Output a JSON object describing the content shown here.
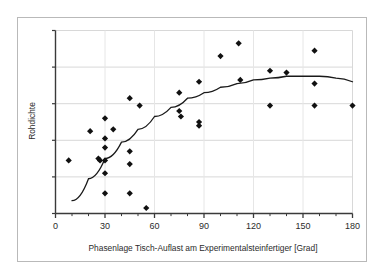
{
  "chart_data": {
    "type": "scatter",
    "title": "",
    "xlabel": "Phasenlage Tisch-Auflast am Experimentalsteinfertiger [Grad]",
    "ylabel": "Rohdichte",
    "xlim": [
      0,
      180
    ],
    "ylim": [
      0,
      100
    ],
    "xticks": [
      0,
      30,
      60,
      90,
      120,
      150,
      180
    ],
    "xtick_labels": [
      "0",
      "30",
      "60",
      "90",
      "120",
      "150",
      "180"
    ],
    "xminor_tick_step": 10,
    "yticks": [
      0,
      20,
      40,
      60,
      80,
      100
    ],
    "ytick_labels": [
      "",
      "",
      "",
      "",
      "",
      ""
    ],
    "grid": true,
    "grid_axis": "y",
    "legend": false,
    "marker": "diamond",
    "marker_color": "#111111",
    "line_color": "#1a1a1a",
    "axis_color": "#3a3a3a",
    "grid_color": "#d8d8d8",
    "points": [
      {
        "x": 8,
        "y": 29
      },
      {
        "x": 21,
        "y": 45
      },
      {
        "x": 26,
        "y": 30
      },
      {
        "x": 27,
        "y": 29
      },
      {
        "x": 30,
        "y": 52
      },
      {
        "x": 30,
        "y": 41
      },
      {
        "x": 30,
        "y": 36
      },
      {
        "x": 30,
        "y": 29
      },
      {
        "x": 30,
        "y": 22
      },
      {
        "x": 30,
        "y": 11
      },
      {
        "x": 35,
        "y": 46
      },
      {
        "x": 45,
        "y": 63
      },
      {
        "x": 45,
        "y": 34
      },
      {
        "x": 45,
        "y": 27
      },
      {
        "x": 45,
        "y": 11
      },
      {
        "x": 51,
        "y": 59
      },
      {
        "x": 55,
        "y": 3
      },
      {
        "x": 75,
        "y": 66
      },
      {
        "x": 75,
        "y": 56
      },
      {
        "x": 76,
        "y": 53
      },
      {
        "x": 87,
        "y": 72
      },
      {
        "x": 87,
        "y": 50
      },
      {
        "x": 87,
        "y": 48
      },
      {
        "x": 100,
        "y": 86
      },
      {
        "x": 111,
        "y": 93
      },
      {
        "x": 112,
        "y": 73
      },
      {
        "x": 130,
        "y": 78
      },
      {
        "x": 130,
        "y": 59
      },
      {
        "x": 140,
        "y": 77
      },
      {
        "x": 157,
        "y": 89
      },
      {
        "x": 157,
        "y": 71
      },
      {
        "x": 157,
        "y": 59
      },
      {
        "x": 180,
        "y": 59
      }
    ],
    "fit_curve": {
      "type": "quadratic",
      "description": "fitted trend line peaking near 150 Grad",
      "points": [
        {
          "x": 10,
          "y": 7
        },
        {
          "x": 20,
          "y": 19
        },
        {
          "x": 30,
          "y": 30
        },
        {
          "x": 40,
          "y": 39
        },
        {
          "x": 50,
          "y": 46
        },
        {
          "x": 60,
          "y": 53
        },
        {
          "x": 70,
          "y": 58
        },
        {
          "x": 80,
          "y": 63
        },
        {
          "x": 90,
          "y": 66
        },
        {
          "x": 100,
          "y": 69
        },
        {
          "x": 110,
          "y": 71
        },
        {
          "x": 120,
          "y": 73
        },
        {
          "x": 130,
          "y": 74
        },
        {
          "x": 140,
          "y": 75
        },
        {
          "x": 150,
          "y": 75
        },
        {
          "x": 160,
          "y": 75
        },
        {
          "x": 170,
          "y": 74
        },
        {
          "x": 180,
          "y": 72
        }
      ]
    }
  }
}
